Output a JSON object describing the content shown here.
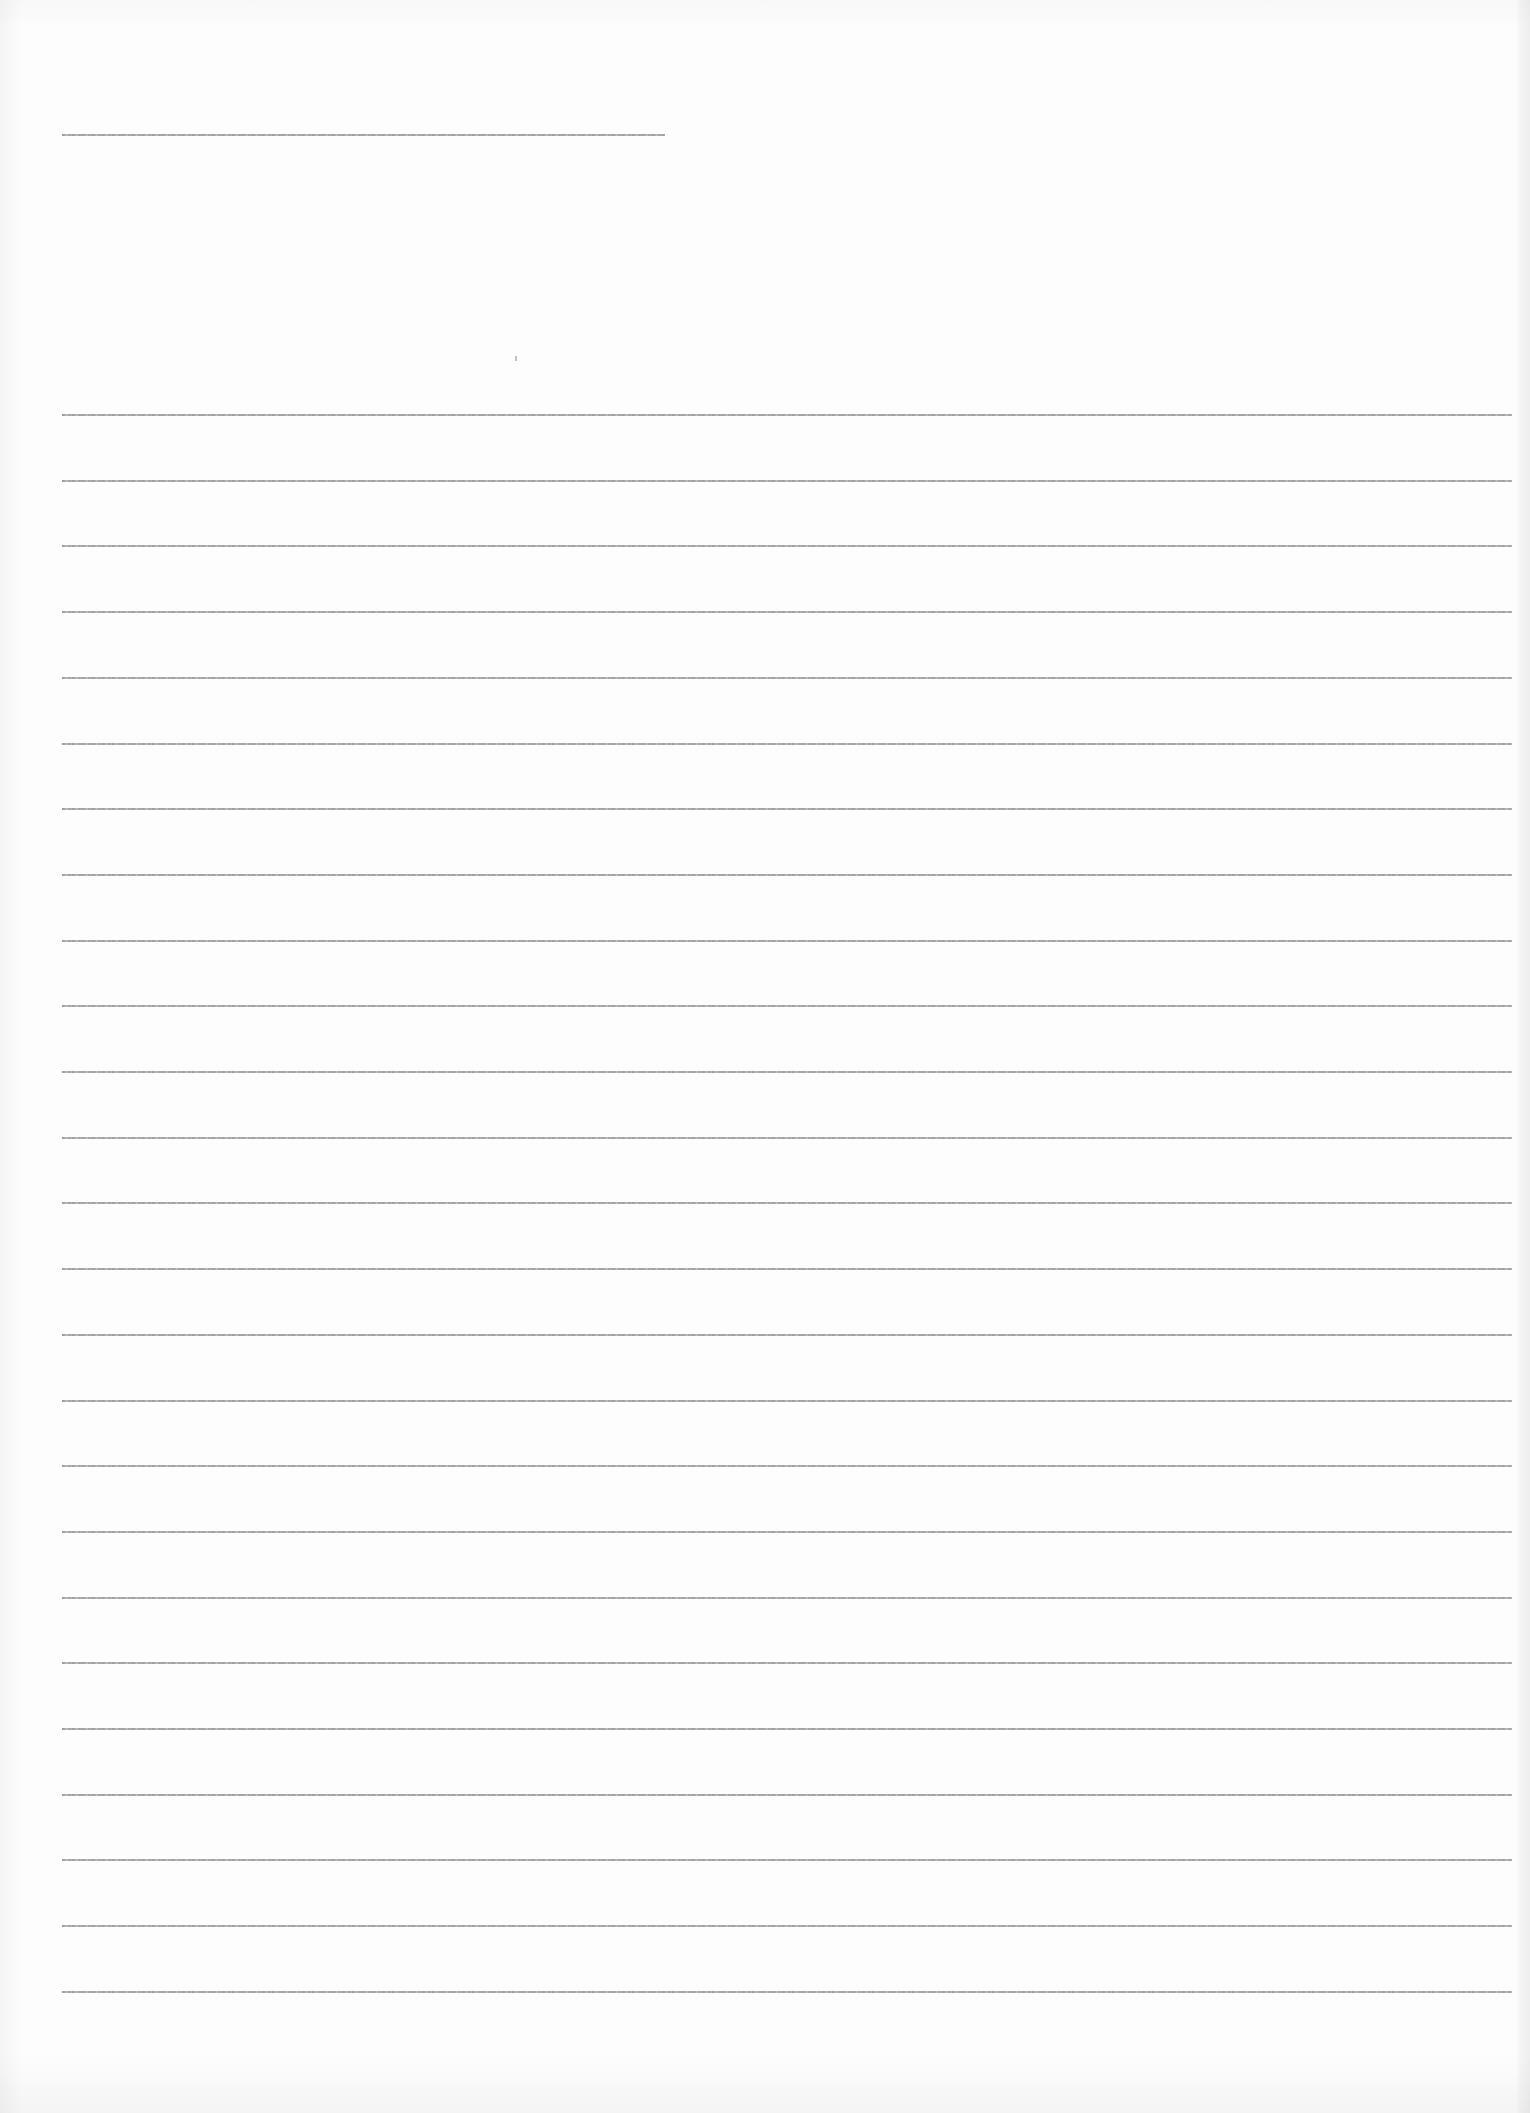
{
  "document": {
    "type": "blank ruled sheet",
    "background_color": "#fdfdfd",
    "line_color": "#9a9a9a",
    "header_line": {
      "x_start": 62,
      "x_end": 665,
      "y": 134
    },
    "ruled_lines": {
      "count": 25,
      "x_start": 62,
      "x_end": 1512,
      "first_y": 414,
      "spacing": 65.7
    },
    "text_content": ""
  }
}
